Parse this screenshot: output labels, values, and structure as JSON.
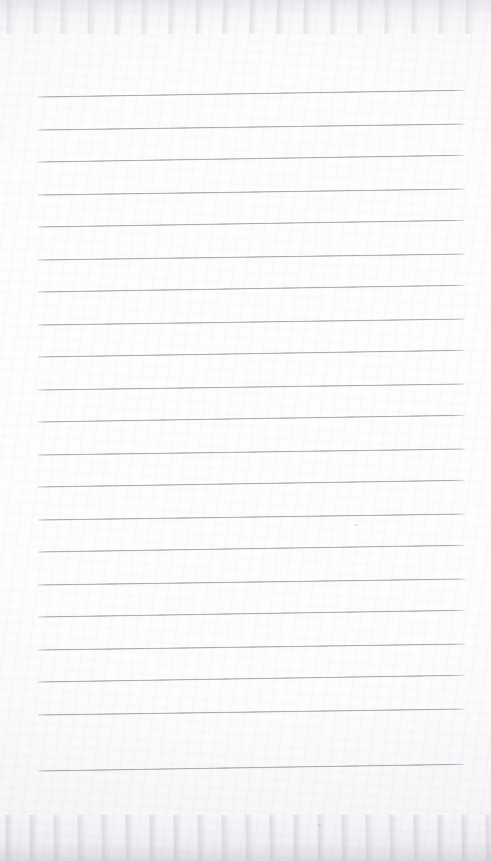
{
  "document": {
    "kind": "scanned-lined-paper",
    "title": "",
    "body_text": "",
    "has_written_content": false,
    "orientation": "portrait",
    "page_width": 491,
    "page_height": 861
  },
  "paper": {
    "background_color": "#fdfdfd",
    "edge_tint_color": "#f6f6f7",
    "scan_grain_color": "#c8c8d0"
  },
  "ruling": {
    "line_color": "#a2a2aa",
    "line_thickness": 2,
    "line_count": 21,
    "left_x": 38,
    "right_x": 465,
    "line_width": 427,
    "first_line_y": 96,
    "last_line_y": 770,
    "spacing": 33.7,
    "y_positions": [
      96,
      129,
      161,
      194,
      226,
      259,
      291,
      324,
      356,
      389,
      421,
      454,
      486,
      519,
      551,
      584,
      616,
      649,
      681,
      714,
      770
    ],
    "line_slopes": [
      -0.9,
      -0.8,
      -0.9,
      -0.8,
      -0.9,
      -0.8,
      -0.9,
      -0.8,
      -0.9,
      -0.8,
      -0.9,
      -0.8,
      -0.9,
      -0.8,
      -0.9,
      -0.8,
      -0.9,
      -0.8,
      -0.9,
      -0.8,
      -0.9
    ]
  },
  "marks": [
    {
      "name": "scan-speck",
      "x": 355,
      "y": 524
    },
    {
      "name": "scan-speck",
      "x": 318,
      "y": 824
    }
  ]
}
